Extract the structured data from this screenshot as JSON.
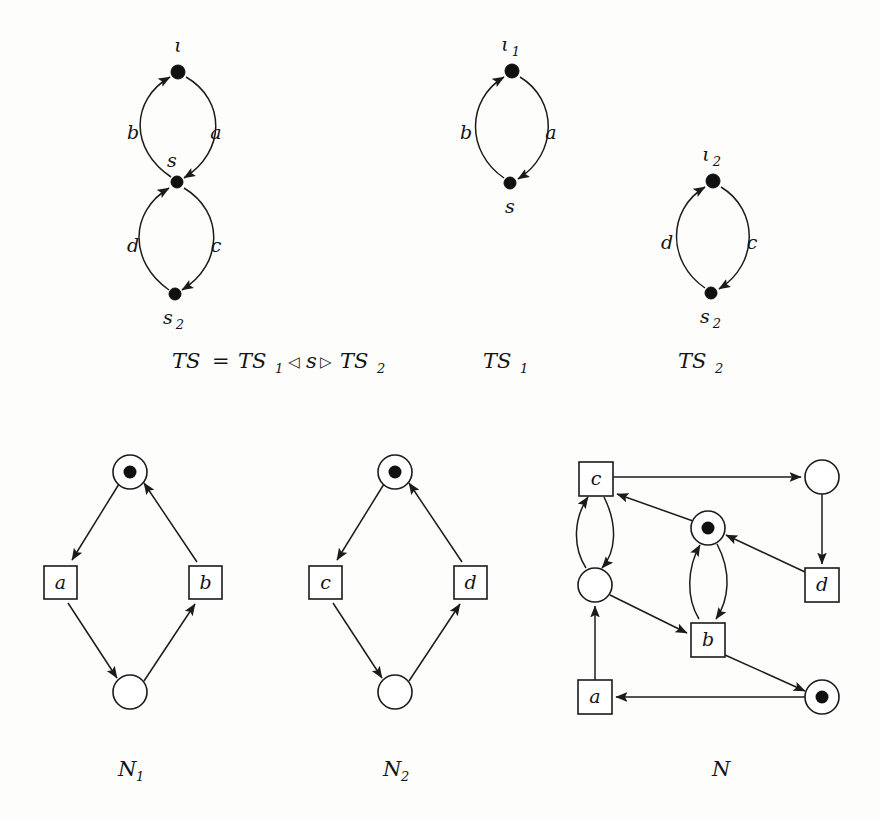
{
  "figure": {
    "kind": "petri-net-and-transition-system-figure",
    "background": "#fdfdfc",
    "ink": "#1b1b1b"
  },
  "transition_systems": [
    {
      "id": "TS",
      "caption_parts": {
        "name": "TS",
        "equals": "=",
        "left_operand": "TS",
        "left_sub": "1",
        "left_triangle": "◁",
        "middle": "s",
        "right_triangle": "▷",
        "right_operand": "TS",
        "right_sub": "2"
      },
      "caption_text": "TS = TS1 ◁ s ▷ TS2",
      "states": [
        {
          "id": "iota",
          "label": "ι",
          "sub": "",
          "cx": 178,
          "cy": 72,
          "label_x": 178,
          "label_y": 50
        },
        {
          "id": "s",
          "label": "s",
          "sub": "",
          "cx": 177,
          "cy": 182,
          "label_x": 170,
          "label_y": 164
        },
        {
          "id": "s2",
          "label": "s",
          "sub": "2",
          "cx": 175,
          "cy": 294,
          "label_x": 168,
          "label_y": 322
        }
      ],
      "edges": [
        {
          "label": "a",
          "from": "iota",
          "to": "s",
          "side": "right",
          "label_x": 212,
          "label_y": 132
        },
        {
          "label": "b",
          "from": "s",
          "to": "iota",
          "side": "left",
          "label_x": 134,
          "label_y": 132
        },
        {
          "label": "c",
          "from": "s",
          "to": "s2",
          "side": "right",
          "label_x": 212,
          "label_y": 245
        },
        {
          "label": "d",
          "from": "s2",
          "to": "s",
          "side": "left",
          "label_x": 134,
          "label_y": 245
        }
      ]
    },
    {
      "id": "TS1",
      "caption_text": "TS1",
      "caption_base": "TS",
      "caption_sub": "1",
      "states": [
        {
          "id": "iota1",
          "label": "ι",
          "sub": "1",
          "cx": 512,
          "cy": 71,
          "label_x": 508,
          "label_y": 49
        },
        {
          "id": "s",
          "label": "s",
          "sub": "",
          "cx": 510,
          "cy": 183,
          "label_x": 509,
          "label_y": 211
        }
      ],
      "edges": [
        {
          "label": "a",
          "from": "iota1",
          "to": "s",
          "side": "right",
          "label_x": 548,
          "label_y": 132
        },
        {
          "label": "b",
          "from": "s",
          "to": "iota1",
          "side": "left",
          "label_x": 466,
          "label_y": 132
        }
      ]
    },
    {
      "id": "TS2",
      "caption_text": "TS2",
      "caption_base": "TS",
      "caption_sub": "2",
      "states": [
        {
          "id": "iota2",
          "label": "ι",
          "sub": "2",
          "cx": 713,
          "cy": 181,
          "label_x": 709,
          "label_y": 159
        },
        {
          "id": "s2",
          "label": "s",
          "sub": "2",
          "cx": 711,
          "cy": 293,
          "label_x": 709,
          "label_y": 322
        }
      ],
      "edges": [
        {
          "label": "c",
          "from": "iota2",
          "to": "s2",
          "side": "right",
          "label_x": 749,
          "label_y": 242
        },
        {
          "label": "d",
          "from": "s2",
          "to": "iota2",
          "side": "left",
          "label_x": 667,
          "label_y": 242
        }
      ]
    }
  ],
  "captions_row1": [
    {
      "id": "cap-TS",
      "x": 170,
      "y": 367
    },
    {
      "id": "cap-TS1",
      "x": 480,
      "y": 367,
      "base": "TS",
      "sub": "1"
    },
    {
      "id": "cap-TS2",
      "x": 675,
      "y": 367,
      "base": "TS",
      "sub": "2"
    }
  ],
  "petri_nets": [
    {
      "id": "N1",
      "caption_base": "N",
      "caption_sub": "1",
      "caption_x": 120,
      "caption_y": 775,
      "places": [
        {
          "id": "p1",
          "cx": 130,
          "cy": 472,
          "r": 17,
          "tokens": 1
        },
        {
          "id": "p2",
          "cx": 130,
          "cy": 692,
          "r": 17,
          "tokens": 0
        }
      ],
      "transitions": [
        {
          "id": "t-a",
          "label": "a",
          "x": 44,
          "y": 566,
          "w": 33,
          "h": 33
        },
        {
          "id": "t-b",
          "label": "b",
          "x": 189,
          "y": 566,
          "w": 33,
          "h": 33
        }
      ],
      "arcs": [
        {
          "from": "p1",
          "to": "t-a"
        },
        {
          "from": "t-a",
          "to": "p2"
        },
        {
          "from": "p2",
          "to": "t-b"
        },
        {
          "from": "t-b",
          "to": "p1"
        }
      ]
    },
    {
      "id": "N2",
      "caption_base": "N",
      "caption_sub": "2",
      "caption_x": 385,
      "caption_y": 775,
      "places": [
        {
          "id": "p1",
          "cx": 395,
          "cy": 472,
          "r": 17,
          "tokens": 1
        },
        {
          "id": "p2",
          "cx": 395,
          "cy": 692,
          "r": 17,
          "tokens": 0
        }
      ],
      "transitions": [
        {
          "id": "t-c",
          "label": "c",
          "x": 309,
          "y": 566,
          "w": 33,
          "h": 33
        },
        {
          "id": "t-d",
          "label": "d",
          "x": 454,
          "y": 566,
          "w": 33,
          "h": 33
        }
      ],
      "arcs": [
        {
          "from": "p1",
          "to": "t-c"
        },
        {
          "from": "t-c",
          "to": "p2"
        },
        {
          "from": "p2",
          "to": "t-d"
        },
        {
          "from": "t-d",
          "to": "p1"
        }
      ]
    },
    {
      "id": "N",
      "caption_base": "N",
      "caption_sub": "",
      "caption_x": 715,
      "caption_y": 775,
      "places": [
        {
          "id": "pTR",
          "cx": 822,
          "cy": 477,
          "r": 17,
          "tokens": 0
        },
        {
          "id": "pM",
          "cx": 708,
          "cy": 528,
          "r": 17,
          "tokens": 1
        },
        {
          "id": "pL",
          "cx": 595,
          "cy": 585,
          "r": 17,
          "tokens": 0
        },
        {
          "id": "pBR",
          "cx": 822,
          "cy": 697,
          "r": 17,
          "tokens": 1
        }
      ],
      "transitions": [
        {
          "id": "t-c",
          "label": "c",
          "x": 579,
          "y": 462,
          "w": 34,
          "h": 34
        },
        {
          "id": "t-d",
          "label": "d",
          "x": 805,
          "y": 568,
          "w": 34,
          "h": 34
        },
        {
          "id": "t-b",
          "label": "b",
          "x": 691,
          "y": 623,
          "w": 34,
          "h": 34
        },
        {
          "id": "t-a",
          "label": "a",
          "x": 578,
          "y": 680,
          "w": 34,
          "h": 34
        }
      ],
      "arcs": [
        {
          "from": "t-c",
          "to": "pTR",
          "style": "straight"
        },
        {
          "from": "pTR",
          "to": "t-d",
          "style": "straight"
        },
        {
          "from": "t-d",
          "to": "pM",
          "style": "straight"
        },
        {
          "from": "pM",
          "to": "t-c",
          "style": "straight"
        },
        {
          "from": "t-c",
          "to": "pL",
          "style": "curve-right"
        },
        {
          "from": "pL",
          "to": "t-c",
          "style": "curve-left"
        },
        {
          "from": "pM",
          "to": "t-b",
          "style": "curve-right"
        },
        {
          "from": "t-b",
          "to": "pM",
          "style": "curve-left"
        },
        {
          "from": "pL",
          "to": "t-b",
          "style": "straight"
        },
        {
          "from": "t-b",
          "to": "pBR",
          "style": "straight"
        },
        {
          "from": "pBR",
          "to": "t-a",
          "style": "straight"
        },
        {
          "from": "t-a",
          "to": "pL",
          "style": "straight"
        }
      ]
    }
  ]
}
